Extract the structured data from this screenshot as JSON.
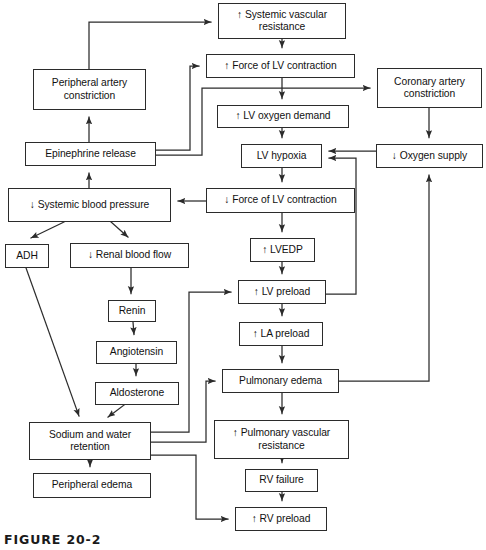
{
  "figure": {
    "caption": "FIGURE 20-2",
    "width": 486,
    "height": 550,
    "line_color": "#2b2b2b",
    "text_color": "#111111",
    "background": "#ffffff"
  },
  "diagram": {
    "type": "flowchart",
    "nodes": [
      {
        "id": "svr",
        "label": "↑ Systemic vascular\nresistance",
        "x": 218,
        "y": 3,
        "w": 128,
        "h": 36
      },
      {
        "id": "pac",
        "label": "Peripheral artery\nconstriction",
        "x": 33,
        "y": 69,
        "w": 113,
        "h": 41
      },
      {
        "id": "flvc_up",
        "label": "↑ Force of LV contraction",
        "x": 206,
        "y": 54,
        "w": 149,
        "h": 24
      },
      {
        "id": "cac",
        "label": "Coronary artery\nconstriction",
        "x": 377,
        "y": 68,
        "w": 105,
        "h": 40
      },
      {
        "id": "lvod",
        "label": "↑ LV oxygen demand",
        "x": 217,
        "y": 105,
        "w": 132,
        "h": 23
      },
      {
        "id": "epi",
        "label": "Epinephrine release",
        "x": 25,
        "y": 142,
        "w": 131,
        "h": 24
      },
      {
        "id": "lvhyp",
        "label": "LV hypoxia",
        "x": 241,
        "y": 144,
        "w": 81,
        "h": 24
      },
      {
        "id": "o2supply",
        "label": "↓ Oxygen supply",
        "x": 376,
        "y": 144,
        "w": 107,
        "h": 24
      },
      {
        "id": "sbp",
        "label": "↓ Systemic blood pressure",
        "x": 8,
        "y": 188,
        "w": 163,
        "h": 34
      },
      {
        "id": "flvc_down",
        "label": "↓ Force of LV contraction",
        "x": 206,
        "y": 188,
        "w": 149,
        "h": 25
      },
      {
        "id": "adh",
        "label": "ADH",
        "x": 5,
        "y": 244,
        "w": 44,
        "h": 24
      },
      {
        "id": "rbf",
        "label": "↓ Renal blood flow",
        "x": 70,
        "y": 243,
        "w": 119,
        "h": 25
      },
      {
        "id": "lvedp",
        "label": "↑ LVEDP",
        "x": 250,
        "y": 238,
        "w": 65,
        "h": 24
      },
      {
        "id": "renin",
        "label": "Renin",
        "x": 108,
        "y": 300,
        "w": 48,
        "h": 22
      },
      {
        "id": "lvpre",
        "label": "↑ LV preload",
        "x": 238,
        "y": 280,
        "w": 88,
        "h": 24
      },
      {
        "id": "angio",
        "label": "Angiotensin",
        "x": 96,
        "y": 341,
        "w": 81,
        "h": 23
      },
      {
        "id": "lapre",
        "label": "↑ LA preload",
        "x": 239,
        "y": 322,
        "w": 84,
        "h": 24
      },
      {
        "id": "aldo",
        "label": "Aldosterone",
        "x": 95,
        "y": 382,
        "w": 84,
        "h": 23
      },
      {
        "id": "pedema",
        "label": "Pulmonary edema",
        "x": 222,
        "y": 369,
        "w": 117,
        "h": 24
      },
      {
        "id": "sodium",
        "label": "Sodium and water\nretention",
        "x": 29,
        "y": 422,
        "w": 122,
        "h": 38
      },
      {
        "id": "pvr",
        "label": "↑ Pulmonary vascular\nresistance",
        "x": 214,
        "y": 420,
        "w": 135,
        "h": 39
      },
      {
        "id": "rvfail",
        "label": "RV failure",
        "x": 245,
        "y": 469,
        "w": 73,
        "h": 23
      },
      {
        "id": "periph_edema",
        "label": "Peripheral edema",
        "x": 33,
        "y": 473,
        "w": 118,
        "h": 25
      },
      {
        "id": "rvpre",
        "label": "↑ RV preload",
        "x": 235,
        "y": 507,
        "w": 92,
        "h": 24
      }
    ],
    "edges": [
      {
        "from": "pac",
        "to": "svr",
        "kind": "elbow-up-right"
      },
      {
        "from": "svr",
        "to": "flvc_up",
        "kind": "straight-down"
      },
      {
        "from": "flvc_up",
        "to": "lvod",
        "kind": "straight-down"
      },
      {
        "from": "flvc_up",
        "to": "cac",
        "kind": "branch-right"
      },
      {
        "from": "lvod",
        "to": "lvhyp",
        "kind": "straight-down"
      },
      {
        "from": "cac",
        "to": "o2supply",
        "kind": "straight-down"
      },
      {
        "from": "epi",
        "to": "pac",
        "kind": "straight-up"
      },
      {
        "from": "epi",
        "to": "flvc_up",
        "kind": "elbow-right-up"
      },
      {
        "from": "epi",
        "to": "cac",
        "kind": "elbow-right-up-right"
      },
      {
        "from": "o2supply",
        "to": "lvhyp",
        "kind": "straight-left"
      },
      {
        "from": "lvhyp",
        "to": "flvc_down",
        "kind": "straight-down"
      },
      {
        "from": "flvc_down",
        "to": "sbp",
        "kind": "straight-left"
      },
      {
        "from": "flvc_down",
        "to": "lvedp",
        "kind": "straight-down"
      },
      {
        "from": "sbp",
        "to": "epi",
        "kind": "straight-up"
      },
      {
        "from": "sbp",
        "to": "adh",
        "kind": "diagonal"
      },
      {
        "from": "sbp",
        "to": "rbf",
        "kind": "diagonal"
      },
      {
        "from": "adh",
        "to": "sodium",
        "kind": "diagonal-long"
      },
      {
        "from": "rbf",
        "to": "renin",
        "kind": "straight-down"
      },
      {
        "from": "renin",
        "to": "angio",
        "kind": "straight-down"
      },
      {
        "from": "angio",
        "to": "aldo",
        "kind": "straight-down"
      },
      {
        "from": "aldo",
        "to": "sodium",
        "kind": "diagonal"
      },
      {
        "from": "lvedp",
        "to": "lvpre",
        "kind": "straight-down"
      },
      {
        "from": "lvpre",
        "to": "lapre",
        "kind": "straight-down"
      },
      {
        "from": "lvpre",
        "to": "lvhyp",
        "kind": "elbow-right-up"
      },
      {
        "from": "lapre",
        "to": "pedema",
        "kind": "straight-down"
      },
      {
        "from": "pedema",
        "to": "pvr",
        "kind": "straight-down"
      },
      {
        "from": "pedema",
        "to": "o2supply",
        "kind": "elbow-right-up"
      },
      {
        "from": "pvr",
        "to": "rvfail",
        "kind": "straight-down"
      },
      {
        "from": "rvfail",
        "to": "rvpre",
        "kind": "straight-down"
      },
      {
        "from": "sodium",
        "to": "lvpre",
        "kind": "elbow-right-up"
      },
      {
        "from": "sodium",
        "to": "pedema",
        "kind": "elbow-right-up"
      },
      {
        "from": "sodium",
        "to": "rvpre",
        "kind": "elbow-right-down"
      },
      {
        "from": "sodium",
        "to": "periph_edema",
        "kind": "straight-down"
      }
    ]
  }
}
